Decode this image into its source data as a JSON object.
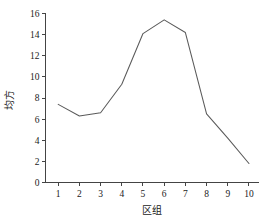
{
  "chart_data": {
    "type": "line",
    "title": "",
    "xlabel": "区组",
    "ylabel": "均方",
    "x": [
      1,
      2,
      3,
      4,
      5,
      6,
      7,
      8,
      9,
      10
    ],
    "values": [
      7.4,
      6.3,
      6.6,
      9.3,
      14.1,
      15.4,
      14.2,
      6.5,
      4.2,
      1.8
    ],
    "series": [
      {
        "name": "均方",
        "values": [
          7.4,
          6.3,
          6.6,
          9.3,
          14.1,
          15.4,
          14.2,
          6.5,
          4.2,
          1.8
        ]
      }
    ],
    "xlim": [
      0.4,
      10.45
    ],
    "ylim": [
      0,
      16
    ],
    "x_ticks": [
      1,
      2,
      3,
      4,
      5,
      6,
      7,
      8,
      9,
      10
    ],
    "x_tick_labels": [
      "1",
      "2",
      "3",
      "4",
      "5",
      "6",
      "7",
      "8",
      "9",
      "10"
    ],
    "y_ticks": [
      0,
      2,
      4,
      6,
      8,
      10,
      12,
      14,
      16
    ],
    "y_tick_labels": [
      "0",
      "2",
      "4",
      "6",
      "8",
      "10",
      "12",
      "14",
      "16"
    ],
    "grid": false,
    "legend": false,
    "legend_position": "none",
    "markers": false,
    "line_color": "#5a5a5a",
    "axis_color": "#444444",
    "background_color": "#ffffff",
    "spines": [
      "left",
      "bottom"
    ]
  }
}
